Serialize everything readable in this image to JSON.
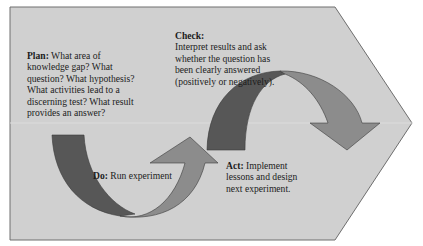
{
  "diagram": {
    "type": "PDCA cycle",
    "background_shape": "chevron-pentagon",
    "colors": {
      "background_fill": "#d0d0d0",
      "outline": "#6e6e6e",
      "arrow_dark": "#575757",
      "arrow_light": "#8c8c8c"
    },
    "steps": {
      "plan": {
        "title": "Plan:",
        "text": " What area of knowledge gap? What question? What hypothesis? What activities lead to a discerning test? What result provides an answer?"
      },
      "do": {
        "title": "Do:",
        "text": " Run experiment"
      },
      "check": {
        "title": "Check:",
        "text": "Interpret results and ask whether the question has been clearly answered (positively or negatively)."
      },
      "act": {
        "title": "Act:",
        "text": " Implement lessons and design next experiment."
      }
    }
  }
}
